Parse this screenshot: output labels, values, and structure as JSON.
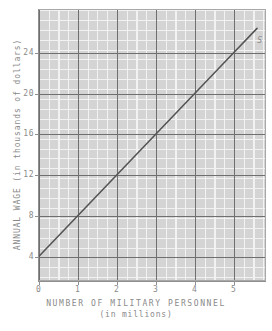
{
  "chart_data": {
    "type": "line",
    "title": "",
    "xlabel": "NUMBER OF MILITARY PERSONNEL",
    "xlabel_sub": "(in millions)",
    "ylabel": "ANNUAL WAGE (in thousands of dollars)",
    "xlim": [
      -0.02,
      5.83
    ],
    "ylim": [
      1.6,
      28.3
    ],
    "x_ticks": [
      0,
      1,
      2,
      3,
      4,
      5
    ],
    "x_tick_labels": [
      "0",
      "1",
      "2",
      "3",
      "4",
      "5"
    ],
    "y_ticks": [
      4,
      8,
      12,
      16,
      20,
      24
    ],
    "y_tick_labels": [
      "4",
      "8",
      "12",
      "16",
      "20",
      "24"
    ],
    "grid": true,
    "minor_grid": true,
    "minor_divisions": 4,
    "legend_position": "inline-annotation",
    "series": [
      {
        "name": "S",
        "label": "S",
        "type": "line",
        "color": "#555555",
        "description": "Labor supply curve: annual wage rises with number of military personnel",
        "slope": 4,
        "intercept": 4,
        "x": [
          0,
          1,
          2,
          3,
          4,
          5,
          5.6
        ],
        "values": [
          4,
          8,
          12,
          16,
          20,
          24,
          26.4
        ],
        "points": [
          {
            "x": 0,
            "y": 4
          },
          {
            "x": 1,
            "y": 8
          },
          {
            "x": 2,
            "y": 12
          },
          {
            "x": 3,
            "y": 16
          },
          {
            "x": 4,
            "y": 20
          },
          {
            "x": 5,
            "y": 24
          },
          {
            "x": 5.6,
            "y": 26.4
          }
        ]
      }
    ],
    "annotations": [
      {
        "text": "S",
        "x": 5.5,
        "y": 25.2,
        "name": "supply-curve-label"
      }
    ]
  },
  "colors": {
    "plot_background": "#d4d4d4",
    "minor_gridline": "#f2f2f2",
    "major_gridline": "#6f6f6f",
    "axis_line": "#8f8f8f",
    "text": "#8a8a8a",
    "series_line": "#555555",
    "page_background": "#ffffff"
  }
}
